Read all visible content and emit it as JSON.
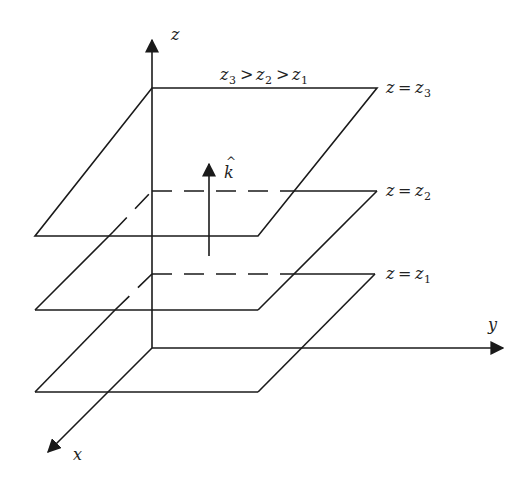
{
  "diagram": {
    "axes": {
      "z_label": "z",
      "y_label": "y",
      "x_label": "x"
    },
    "unit_vector": {
      "symbol": "k",
      "hat": "^"
    },
    "ordering": {
      "a": "z",
      "a_sub": "3",
      "gt1": ">",
      "b": "z",
      "b_sub": "2",
      "gt2": ">",
      "c": "z",
      "c_sub": "1"
    },
    "planes": [
      {
        "lhs": "z",
        "eq": "=",
        "rhs": "z",
        "sub": "3"
      },
      {
        "lhs": "z",
        "eq": "=",
        "rhs": "z",
        "sub": "2"
      },
      {
        "lhs": "z",
        "eq": "=",
        "rhs": "z",
        "sub": "1"
      }
    ],
    "colors": {
      "line": "#1a1a1a",
      "background": "#ffffff"
    }
  }
}
